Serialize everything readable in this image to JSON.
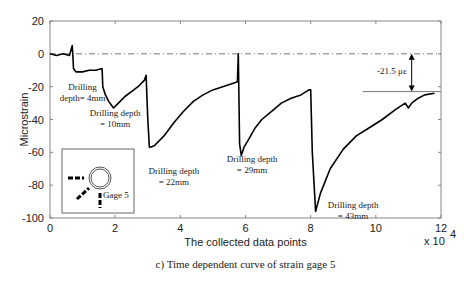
{
  "chart_data": {
    "type": "line",
    "title": "",
    "caption": "c) Time dependent curve of strain gage 5",
    "xlabel": "The collected data points",
    "ylabel": "Microstrain",
    "x_multiplier": "x 10",
    "x_multiplier_exp": "4",
    "xlim": [
      0,
      12
    ],
    "ylim": [
      -100,
      20
    ],
    "xticks": [
      "0",
      "2",
      "4",
      "6",
      "8",
      "10",
      "12"
    ],
    "yticks": [
      "20",
      "0",
      "-20",
      "-40",
      "-60",
      "-80",
      "-100"
    ],
    "grid": false,
    "series": [
      {
        "name": "strain gage 5",
        "x": [
          0,
          0.2,
          0.4,
          0.6,
          0.68,
          0.7,
          0.72,
          0.8,
          1.0,
          1.2,
          1.4,
          1.6,
          1.62,
          1.7,
          1.8,
          1.95,
          2.1,
          2.3,
          2.5,
          2.7,
          2.9,
          2.95,
          3.0,
          3.05,
          3.2,
          3.5,
          3.8,
          4.1,
          4.4,
          4.7,
          5.0,
          5.3,
          5.6,
          5.75,
          5.78,
          5.82,
          5.87,
          5.95,
          6.1,
          6.3,
          6.5,
          6.8,
          7.1,
          7.4,
          7.7,
          7.95,
          8.0,
          8.05,
          8.15,
          8.3,
          8.6,
          9.0,
          9.4,
          9.8,
          10.2,
          10.6,
          10.9,
          11.0,
          11.1,
          11.3,
          11.5,
          11.8
        ],
        "y": [
          0,
          -1,
          0,
          -1,
          5,
          0,
          -9,
          -11,
          -11,
          -10,
          -10,
          -9,
          -20,
          -25,
          -29,
          -33,
          -30,
          -26,
          -23,
          -20,
          -16,
          -13,
          -40,
          -57,
          -56,
          -50,
          -42,
          -35,
          -29,
          -25,
          -22,
          -20,
          -18,
          -17,
          0,
          -55,
          -62,
          -57,
          -52,
          -45,
          -40,
          -35,
          -30,
          -27,
          -25,
          -22,
          -22,
          -60,
          -96,
          -85,
          -70,
          -58,
          -50,
          -45,
          -40,
          -34,
          -30,
          -33,
          -30,
          -27,
          -25,
          -24
        ]
      }
    ],
    "reference_line": {
      "y": 0,
      "style": "dash-dot"
    },
    "annotations": [
      {
        "text_lines": [
          "Drilling",
          "depth= 4mm"
        ],
        "x": 1.0,
        "y": -22
      },
      {
        "text_lines": [
          "Drilling depth",
          "= 10mm"
        ],
        "x": 2.0,
        "y": -38
      },
      {
        "text_lines": [
          "Drilling depth",
          "= 22mm"
        ],
        "x": 3.8,
        "y": -73
      },
      {
        "text_lines": [
          "Drilling depth",
          "= 29mm"
        ],
        "x": 6.2,
        "y": -66
      },
      {
        "text_lines": [
          "Drilling depth",
          "= 43mm"
        ],
        "x": 9.3,
        "y": -94
      },
      {
        "text_lines": [
          "-21.5 με"
        ],
        "x": 10.0,
        "y": -11
      }
    ],
    "delta_marker": {
      "x": 11.1,
      "y_top": 0,
      "y_bottom": -23,
      "label": "-21.5 με"
    },
    "inset": {
      "label": "Gage 5"
    }
  }
}
